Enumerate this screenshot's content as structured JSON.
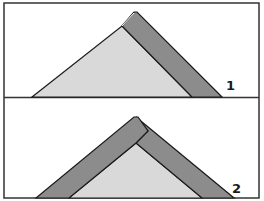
{
  "figure": {
    "panels": [
      {
        "id": 1,
        "label": "1",
        "description": "Single board leaning on right slope of triangle",
        "colors": {
          "light": "#d9d9d9",
          "dark": "#8c8c8c",
          "stroke": "#1a1a1a"
        }
      },
      {
        "id": 2,
        "label": "2",
        "description": "Two boards forming an inverted V over triangle",
        "colors": {
          "light": "#d9d9d9",
          "dark": "#8c8c8c",
          "stroke": "#1a1a1a"
        }
      }
    ],
    "border_color": "#333333",
    "background": "#ffffff"
  }
}
